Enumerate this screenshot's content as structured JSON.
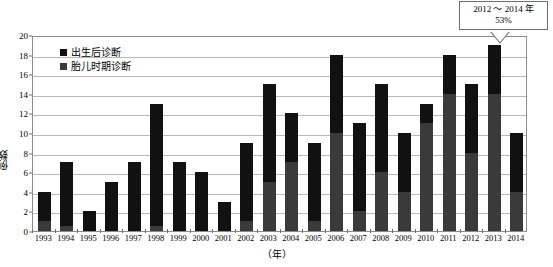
{
  "chart_data": {
    "type": "bar",
    "stacked": true,
    "title": "",
    "subtitle": "",
    "xlabel": "（年）",
    "ylabel": "例数",
    "ylim": [
      0,
      20
    ],
    "ytick_step": 2,
    "yticks": [
      0,
      2,
      4,
      6,
      8,
      10,
      12,
      14,
      16,
      18,
      20
    ],
    "grid": true,
    "legend_position": "inside-top-left",
    "categories": [
      "1993",
      "1994",
      "1995",
      "1996",
      "1997",
      "1998",
      "1999",
      "2000",
      "2001",
      "2002",
      "2003",
      "2004",
      "2005",
      "2006",
      "2007",
      "2008",
      "2009",
      "2010",
      "2011",
      "2012",
      "2013",
      "2014"
    ],
    "series": [
      {
        "name": "胎儿时期诊断",
        "color": "#3a3a3a",
        "values": [
          1,
          0.5,
          0,
          0,
          0,
          0.5,
          0,
          0,
          0,
          1,
          5,
          7,
          1,
          10,
          2,
          6,
          4,
          11,
          14,
          8,
          14,
          4
        ]
      },
      {
        "name": "出生后诊断",
        "color": "#111111",
        "values": [
          3,
          6.5,
          2,
          5,
          7,
          12.5,
          7,
          6,
          3,
          8,
          10,
          5,
          8,
          8,
          9,
          9,
          6,
          2,
          4,
          7,
          5,
          6
        ]
      }
    ],
    "totals": [
      4,
      7,
      2,
      5,
      7,
      13,
      7,
      6,
      3,
      9,
      15,
      12,
      9,
      18,
      11,
      15,
      10,
      13,
      18,
      15,
      19,
      10
    ],
    "annotations": [
      {
        "name": "rate-callout",
        "lines": [
          "2012 ～ 2014 年",
          "53%"
        ],
        "points_to": "2013"
      }
    ]
  },
  "legend": {
    "items": [
      {
        "label": "出生后诊断",
        "color": "#111111"
      },
      {
        "label": "胎儿时期诊断",
        "color": "#3a3a3a"
      }
    ]
  },
  "callout": {
    "line1": "2012 ～ 2014 年",
    "line2": "53%"
  },
  "axes": {
    "ylabel": "例数",
    "xlabel": "（年）"
  }
}
